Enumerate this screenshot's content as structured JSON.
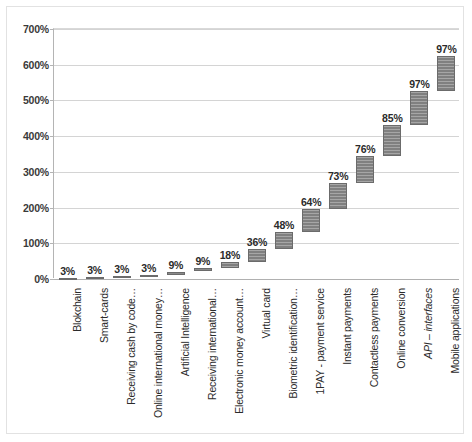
{
  "chart_data": {
    "type": "bar",
    "subtype": "waterfall",
    "title": "",
    "xlabel": "",
    "ylabel": "",
    "ylim": [
      0,
      700
    ],
    "ytick_values": [
      0,
      100,
      200,
      300,
      400,
      500,
      600,
      700
    ],
    "ytick_labels": [
      "0%",
      "100%",
      "200%",
      "300%",
      "400%",
      "500%",
      "600%",
      "700%"
    ],
    "grid": true,
    "legend": "none",
    "bar_color": "#808080",
    "bar_edge_color": "#6b6b6b",
    "categories": [
      "Blokchain",
      "Smart-cards",
      "Receiving cash by code…",
      "Online international money…",
      "Artificial Intelligence",
      "Receiving international…",
      "Electronic money account…",
      "Virtual card",
      "Biometric identification…",
      "1PAY - payment service",
      "Instant payments",
      "Contactless payments",
      "Online conversion",
      "API – interfaces",
      "Mobile applications"
    ],
    "categories_italic": [
      false,
      false,
      false,
      false,
      false,
      false,
      false,
      false,
      false,
      false,
      false,
      false,
      false,
      true,
      false
    ],
    "values": [
      3,
      3,
      3,
      3,
      9,
      9,
      18,
      36,
      48,
      64,
      73,
      76,
      85,
      97,
      97
    ],
    "data_labels": [
      "3%",
      "3%",
      "3%",
      "3%",
      "9%",
      "9%",
      "18%",
      "36%",
      "48%",
      "64%",
      "73%",
      "76%",
      "85%",
      "97%",
      "97%"
    ],
    "cumulative_base": [
      0,
      3,
      6,
      9,
      12,
      21,
      30,
      48,
      84,
      132,
      196,
      269,
      345,
      430,
      527
    ],
    "cumulative_top": [
      3,
      6,
      9,
      12,
      21,
      30,
      48,
      84,
      132,
      196,
      269,
      345,
      430,
      527,
      624
    ],
    "total": 624
  }
}
